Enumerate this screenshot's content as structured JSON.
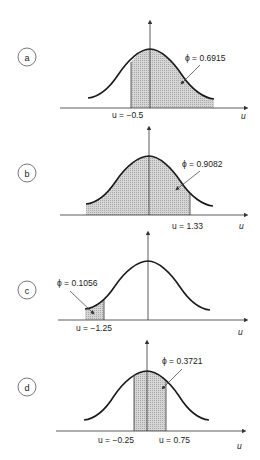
{
  "figure": {
    "axis_label": "u",
    "panels": [
      {
        "id": "a",
        "label": "a",
        "phi_label": "ϕ = 0.6915",
        "u_labels": [
          "u = −0.5"
        ],
        "shade_from": -0.5,
        "shade_to": null,
        "shaded_region": "right tail from u = -0.5"
      },
      {
        "id": "b",
        "label": "b",
        "phi_label": "ϕ = 0.9082",
        "u_labels": [
          "u = 1.33"
        ],
        "shade_from": null,
        "shade_to": 1.33,
        "shaded_region": "left of u = 1.33"
      },
      {
        "id": "c",
        "label": "c",
        "phi_label": "ϕ = 0.1056",
        "u_labels": [
          "u = −1.25"
        ],
        "shade_from": null,
        "shade_to": -1.25,
        "shaded_region": "left of u = -1.25"
      },
      {
        "id": "d",
        "label": "d",
        "phi_label": "ϕ = 0.3721",
        "u_labels": [
          "u = −0.25",
          "u = 0.75"
        ],
        "shade_from": -0.25,
        "shade_to": 0.75,
        "shaded_region": "between u = -0.25 and u = 0.75"
      }
    ]
  },
  "colors": {
    "curve": "#1a1a1a",
    "axis": "#333333",
    "shade": "#c8c8c8",
    "text": "#222222"
  }
}
